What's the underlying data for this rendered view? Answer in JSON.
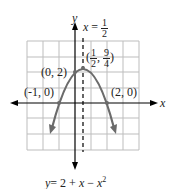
{
  "figure": {
    "axis_x_label": "x",
    "axis_y_label": "y",
    "equation": {
      "lhs": "y",
      "rhs_prefix": "= 2 + ",
      "rhs_var": "x",
      "rhs_minus": " − ",
      "rhs_var2": "x",
      "rhs_exp": "2"
    },
    "axis_of_symmetry": {
      "lhs": "x",
      "eq": "=",
      "num": "1",
      "den": "2"
    },
    "points": [
      {
        "label": "(0, 2)"
      },
      {
        "label": "(-1, 0)"
      },
      {
        "label": "(2, 0)"
      }
    ],
    "vertex": {
      "x_num": "1",
      "x_den": "2",
      "y_num": "9",
      "y_den": "4"
    },
    "colors": {
      "curve": "#6b6b6b",
      "grid": "#bdbdbd",
      "axis": "#000000"
    }
  }
}
